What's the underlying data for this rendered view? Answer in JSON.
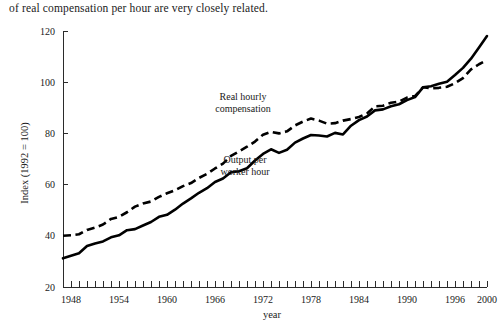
{
  "caption": {
    "text": "of real compensation per hour are very closely related."
  },
  "chart_data": {
    "type": "line",
    "title": "",
    "xlabel": "year",
    "ylabel": "Index (1992 = 100)",
    "xlim": [
      1947,
      2000
    ],
    "ylim": [
      20,
      120
    ],
    "yticks": [
      20,
      40,
      60,
      80,
      100,
      120
    ],
    "ytick_labels": [
      "20",
      "40",
      "60",
      "80",
      "100",
      "120"
    ],
    "xticks": [
      1948,
      1954,
      1960,
      1966,
      1972,
      1978,
      1984,
      1990,
      1996,
      2000
    ],
    "xtick_labels": [
      "1948",
      "1954",
      "1960",
      "1966",
      "1972",
      "1978",
      "1984",
      "1990",
      "1996",
      "2000"
    ],
    "minor_xticks_every": 1,
    "grid": false,
    "legend": "inline-annotations",
    "x": [
      1947,
      1948,
      1949,
      1950,
      1951,
      1952,
      1953,
      1954,
      1955,
      1956,
      1957,
      1958,
      1959,
      1960,
      1961,
      1962,
      1963,
      1964,
      1965,
      1966,
      1967,
      1968,
      1969,
      1970,
      1971,
      1972,
      1973,
      1974,
      1975,
      1976,
      1977,
      1978,
      1979,
      1980,
      1981,
      1982,
      1983,
      1984,
      1985,
      1986,
      1987,
      1988,
      1989,
      1990,
      1991,
      1992,
      1993,
      1994,
      1995,
      1996,
      1997,
      1998,
      1999,
      2000
    ],
    "series": [
      {
        "name": "Real hourly compensation",
        "style": "dashed",
        "annotation": "Real hourly\ncompensation",
        "annotation_line1": "Real hourly",
        "annotation_line2": "compensation",
        "values": [
          40.0,
          40.2,
          40.6,
          42.3,
          43.2,
          44.4,
          46.6,
          47.4,
          49.2,
          51.4,
          52.6,
          53.4,
          55.2,
          56.6,
          57.8,
          59.4,
          60.6,
          62.6,
          64.2,
          66.3,
          68.2,
          71.2,
          73.0,
          74.8,
          76.8,
          79.5,
          80.6,
          80.0,
          80.8,
          83.1,
          84.6,
          85.8,
          85.0,
          83.8,
          84.0,
          85.0,
          85.6,
          86.4,
          87.8,
          90.6,
          90.8,
          92.0,
          92.4,
          94.0,
          94.6,
          98.0,
          97.6,
          97.8,
          98.2,
          99.6,
          101.6,
          105.0,
          107.0,
          108.6
        ]
      },
      {
        "name": "Output per worker hour",
        "style": "solid",
        "annotation": "Output per\nworker hour",
        "annotation_line1": "Output per",
        "annotation_line2": "worker hour",
        "values": [
          31.2,
          32.2,
          33.2,
          36.0,
          37.0,
          37.8,
          39.4,
          40.2,
          42.2,
          42.6,
          44.0,
          45.4,
          47.4,
          48.2,
          50.2,
          52.6,
          54.6,
          56.8,
          58.6,
          61.0,
          62.4,
          64.8,
          65.2,
          66.4,
          69.4,
          72.0,
          73.8,
          72.4,
          73.6,
          76.4,
          78.0,
          79.4,
          79.2,
          78.8,
          80.2,
          79.6,
          83.0,
          85.2,
          86.6,
          89.0,
          89.4,
          90.6,
          91.4,
          93.0,
          94.2,
          98.0,
          98.4,
          99.4,
          100.2,
          102.8,
          105.6,
          109.2,
          113.6,
          118.0
        ]
      }
    ]
  }
}
